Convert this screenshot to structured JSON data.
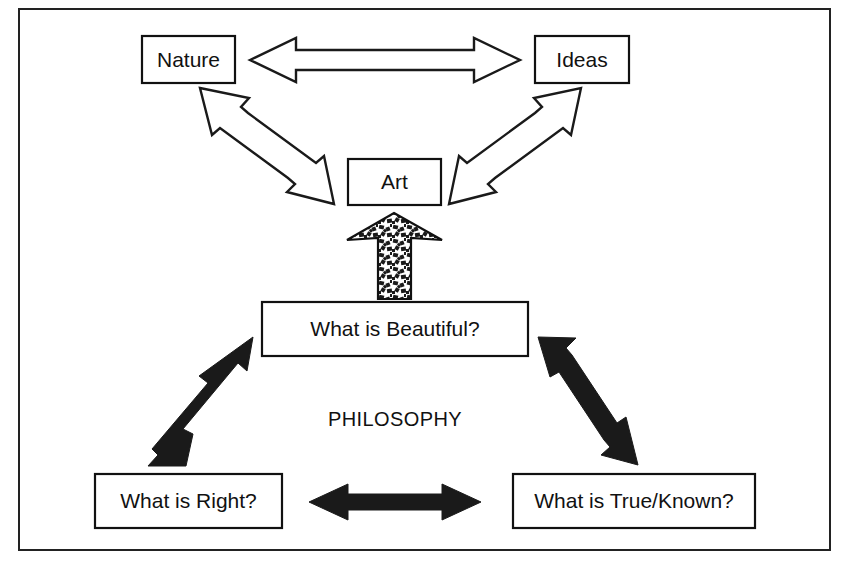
{
  "figure": {
    "frame": {
      "present": true,
      "color": "#222222"
    },
    "background_color": "#ffffff",
    "ink_color": "#111111"
  },
  "upper_group": {
    "name": "Art triad",
    "nodes": [
      {
        "id": "nature",
        "label": "Nature"
      },
      {
        "id": "ideas",
        "label": "Ideas"
      },
      {
        "id": "art",
        "label": "Art"
      }
    ],
    "connectors": [
      {
        "id": "nature-ideas",
        "style": "hollow-double-arrow",
        "from": "Nature",
        "to": "Ideas"
      },
      {
        "id": "nature-art",
        "style": "hollow-double-arrow",
        "from": "Nature",
        "to": "Art"
      },
      {
        "id": "ideas-art",
        "style": "hollow-double-arrow",
        "from": "Ideas",
        "to": "Art"
      }
    ]
  },
  "bridge": {
    "id": "philosophy-to-art",
    "style": "textured-up-arrow",
    "from": "What is Beautiful?",
    "to": "Art",
    "direction": "up"
  },
  "lower_group": {
    "name": "Philosophy triad",
    "heading": "PHILOSOPHY",
    "nodes": [
      {
        "id": "beautiful",
        "label": "What is Beautiful?"
      },
      {
        "id": "right",
        "label": "What is Right?"
      },
      {
        "id": "true-known",
        "label": "What is True/Known?"
      }
    ],
    "connectors": [
      {
        "id": "beautiful-right",
        "style": "solid-double-arrow",
        "from": "What is Beautiful?",
        "to": "What is Right?"
      },
      {
        "id": "beautiful-true",
        "style": "solid-double-arrow",
        "from": "What is Beautiful?",
        "to": "What is True/Known?"
      },
      {
        "id": "right-true",
        "style": "solid-double-arrow",
        "from": "What is Right?",
        "to": "What is True/Known?"
      }
    ]
  }
}
